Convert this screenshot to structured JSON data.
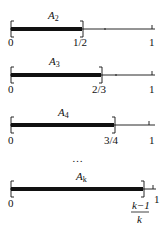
{
  "diagram": {
    "rows": [
      {
        "name": "A",
        "subscript": "2",
        "end_label": "1/2",
        "start_label": "0",
        "one_label": "1",
        "fraction": 0.5
      },
      {
        "name": "A",
        "subscript": "3",
        "end_label": "2/3",
        "start_label": "0",
        "one_label": "1",
        "fraction": 0.6667
      },
      {
        "name": "A",
        "subscript": "4",
        "end_label": "3/4",
        "start_label": "0",
        "one_label": "1",
        "fraction": 0.75
      },
      {
        "name": "A",
        "subscript": "k",
        "end_label_num": "k−1",
        "end_label_den": "k",
        "start_label": "0",
        "one_label": "1",
        "fraction": 0.97
      }
    ],
    "ellipsis": "…",
    "colors": {
      "ink": "#111111",
      "background": "#ffffff"
    }
  }
}
